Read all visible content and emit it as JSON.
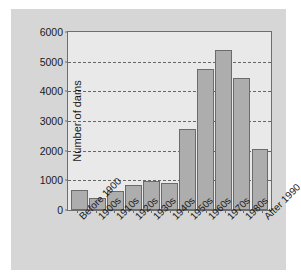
{
  "chart_data": {
    "type": "bar",
    "title": "",
    "xlabel": "",
    "ylabel": "Number of dams",
    "ylim": [
      0,
      6000
    ],
    "yticks": [
      0,
      1000,
      2000,
      3000,
      4000,
      5000,
      6000
    ],
    "ytick_labels": [
      "0",
      "1000",
      "2000",
      "3000",
      "4000",
      "5000",
      "6000"
    ],
    "grid": true,
    "legend": false,
    "categories": [
      "Before 1900",
      "1900s",
      "1910s",
      "1920s",
      "1930s",
      "1940s",
      "1950s",
      "1960s",
      "1970s",
      "1980s",
      "After 1990"
    ],
    "values": [
      670,
      390,
      640,
      830,
      980,
      920,
      2740,
      4740,
      5400,
      4450,
      2070
    ]
  },
  "style": {
    "bar_fill": "#adadad",
    "bar_edge": "#6b6b6b",
    "plot_background": "#e9e9e9",
    "figure_background": "#d6d6d6",
    "axis_color": "#6e6e6e",
    "grid_color": "#676767",
    "text_color": "#1a1a1a"
  }
}
